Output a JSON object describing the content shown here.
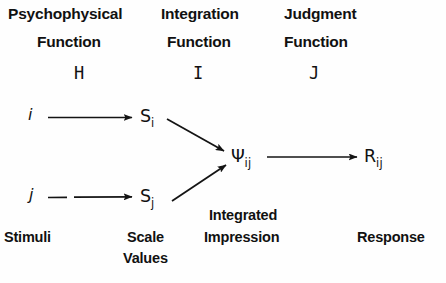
{
  "diagram": {
    "background_color": "#fefefe",
    "ink_color": "#111111",
    "column_headers": [
      {
        "line1": "Psychophysical",
        "line2": "Function",
        "symbol": "H"
      },
      {
        "line1": "Integration",
        "line2": "Function",
        "symbol": "I"
      },
      {
        "line1": "Judgment",
        "line2": "Function",
        "symbol": "J"
      }
    ],
    "nodes": {
      "stimulus_i": "i",
      "stimulus_j": "j",
      "scale_value_i_base": "S",
      "scale_value_i_sub": "i",
      "scale_value_j_base": "S",
      "scale_value_j_sub": "j",
      "integrated_base": "Ψ",
      "integrated_sub": "ij",
      "response_base": "R",
      "response_sub": "ij"
    },
    "bottom_labels": {
      "stimuli": "Stimuli",
      "scale": "Scale",
      "values": "Values",
      "integrated": "Integrated",
      "impression": "Impression",
      "response": "Response"
    },
    "arrows": [
      {
        "name": "i-to-Si",
        "from": "i",
        "to": "S_i"
      },
      {
        "name": "j-to-Sj",
        "from": "j",
        "to": "S_j"
      },
      {
        "name": "Si-to-Psi",
        "from": "S_i",
        "to": "Psi_ij"
      },
      {
        "name": "Sj-to-Psi",
        "from": "S_j",
        "to": "Psi_ij"
      },
      {
        "name": "Psi-to-R",
        "from": "Psi_ij",
        "to": "R_ij"
      }
    ]
  }
}
